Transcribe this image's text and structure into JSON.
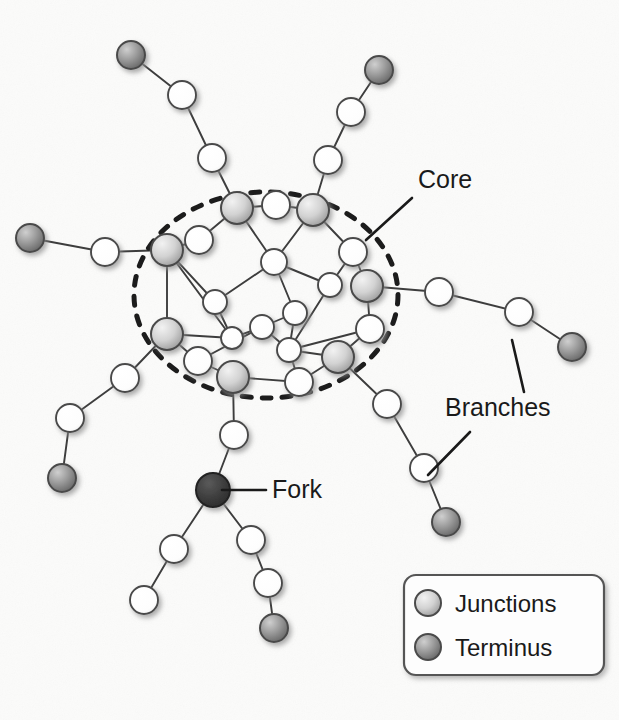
{
  "figure": {
    "kind": "network-diagram",
    "background_color": "#fbfbfa",
    "width": 619,
    "height": 720
  },
  "palette": {
    "edge": "#3d3d3d",
    "node_stroke": "#4a4a4a",
    "node_white_fill": "#ffffff",
    "junction_fill_light": "#e8e8e8",
    "junction_fill_dark": "#a6a6a6",
    "terminus_fill_light": "#bdbdbd",
    "terminus_fill_dark": "#6e6e6e",
    "fork_fill": "#3a3a3a",
    "text": "#1a1a1a",
    "dashed_ellipse": "#1c1c1c",
    "legend_border": "#555555",
    "legend_fill": "#fdfdfd",
    "shadow": "#9a9a9a"
  },
  "annotations": [
    {
      "id": "core",
      "label": "Core",
      "x": 418,
      "y": 188,
      "font_size": 25,
      "leaders": [
        {
          "x1": 412,
          "y1": 198,
          "x2": 366,
          "y2": 240
        }
      ]
    },
    {
      "id": "branches",
      "label": "Branches",
      "x": 445,
      "y": 416,
      "font_size": 25,
      "leaders": [
        {
          "x1": 524,
          "y1": 392,
          "x2": 512,
          "y2": 340
        },
        {
          "x1": 470,
          "y1": 432,
          "x2": 428,
          "y2": 475
        }
      ]
    },
    {
      "id": "fork",
      "label": "Fork",
      "x": 272,
      "y": 498,
      "font_size": 25,
      "leaders": [
        {
          "x1": 266,
          "y1": 490,
          "x2": 222,
          "y2": 490
        }
      ]
    }
  ],
  "core_boundary": {
    "shape": "ellipse",
    "cx": 266,
    "cy": 295,
    "rx": 132,
    "ry": 103,
    "dash": "9 11",
    "stroke_width": 5
  },
  "legend": {
    "box": {
      "x": 404,
      "y": 575,
      "width": 200,
      "height": 100,
      "radius": 12
    },
    "entries": [
      {
        "id": "junctions",
        "label": "Junctions",
        "swatch": "junction",
        "cx": 428,
        "cy": 603,
        "r": 13,
        "text_x": 455,
        "text_y": 612
      },
      {
        "id": "terminus",
        "label": "Terminus",
        "swatch": "terminus",
        "cx": 428,
        "cy": 647,
        "r": 13,
        "text_x": 455,
        "text_y": 656
      }
    ],
    "font_size": 24
  },
  "nodes": [
    {
      "id": "t_ul",
      "x": 131,
      "y": 55,
      "r": 14,
      "type": "terminus",
      "group": "branch-upper-left"
    },
    {
      "id": "b_ul1",
      "x": 182,
      "y": 95,
      "r": 14,
      "type": "white",
      "group": "branch-upper-left"
    },
    {
      "id": "b_ul2",
      "x": 212,
      "y": 158,
      "r": 14,
      "type": "white",
      "group": "branch-upper-left"
    },
    {
      "id": "t_ur",
      "x": 379,
      "y": 70,
      "r": 14,
      "type": "terminus",
      "group": "branch-upper-right"
    },
    {
      "id": "b_ur1",
      "x": 351,
      "y": 112,
      "r": 14,
      "type": "white",
      "group": "branch-upper-right"
    },
    {
      "id": "b_ur2",
      "x": 328,
      "y": 160,
      "r": 14,
      "type": "white",
      "group": "branch-upper-right"
    },
    {
      "id": "t_l",
      "x": 30,
      "y": 238,
      "r": 14,
      "type": "terminus",
      "group": "branch-left"
    },
    {
      "id": "b_l1",
      "x": 105,
      "y": 252,
      "r": 14,
      "type": "white",
      "group": "branch-left"
    },
    {
      "id": "b_r1",
      "x": 439,
      "y": 292,
      "r": 14,
      "type": "white",
      "group": "branch-right"
    },
    {
      "id": "b_r2",
      "x": 519,
      "y": 312,
      "r": 14,
      "type": "white",
      "group": "branch-right"
    },
    {
      "id": "t_r",
      "x": 572,
      "y": 347,
      "r": 14,
      "type": "terminus",
      "group": "branch-right"
    },
    {
      "id": "b_ll1",
      "x": 125,
      "y": 378,
      "r": 14,
      "type": "white",
      "group": "branch-lower-left"
    },
    {
      "id": "b_ll2",
      "x": 70,
      "y": 418,
      "r": 14,
      "type": "white",
      "group": "branch-lower-left"
    },
    {
      "id": "t_ll",
      "x": 62,
      "y": 478,
      "r": 14,
      "type": "terminus",
      "group": "branch-lower-left"
    },
    {
      "id": "b_lr1",
      "x": 387,
      "y": 404,
      "r": 14,
      "type": "white",
      "group": "branch-lower-right"
    },
    {
      "id": "b_lr2",
      "x": 424,
      "y": 468,
      "r": 14,
      "type": "white",
      "group": "branch-lower-right"
    },
    {
      "id": "t_lr",
      "x": 446,
      "y": 522,
      "r": 14,
      "type": "terminus",
      "group": "branch-lower-right"
    },
    {
      "id": "f_stem",
      "x": 234,
      "y": 435,
      "r": 14,
      "type": "white",
      "group": "fork-branch"
    },
    {
      "id": "fork",
      "x": 213,
      "y": 490,
      "r": 17,
      "type": "fork",
      "group": "fork-branch"
    },
    {
      "id": "f_a1",
      "x": 174,
      "y": 549,
      "r": 14,
      "type": "white",
      "group": "fork-branch"
    },
    {
      "id": "f_a2",
      "x": 144,
      "y": 600,
      "r": 14,
      "type": "white",
      "group": "fork-branch"
    },
    {
      "id": "f_b1",
      "x": 251,
      "y": 540,
      "r": 14,
      "type": "white",
      "group": "fork-branch"
    },
    {
      "id": "f_b2",
      "x": 268,
      "y": 583,
      "r": 14,
      "type": "white",
      "group": "fork-branch"
    },
    {
      "id": "t_f",
      "x": 274,
      "y": 628,
      "r": 14,
      "type": "terminus",
      "group": "fork-branch"
    },
    {
      "id": "j_n",
      "x": 237,
      "y": 208,
      "r": 16,
      "type": "junction",
      "group": "core"
    },
    {
      "id": "j_ne",
      "x": 313,
      "y": 210,
      "r": 16,
      "type": "junction",
      "group": "core"
    },
    {
      "id": "j_w",
      "x": 167,
      "y": 250,
      "r": 16,
      "type": "junction",
      "group": "core"
    },
    {
      "id": "j_e",
      "x": 367,
      "y": 286,
      "r": 16,
      "type": "junction",
      "group": "core"
    },
    {
      "id": "j_sw",
      "x": 167,
      "y": 334,
      "r": 16,
      "type": "junction",
      "group": "core"
    },
    {
      "id": "j_s",
      "x": 233,
      "y": 377,
      "r": 16,
      "type": "junction",
      "group": "core"
    },
    {
      "id": "j_se",
      "x": 338,
      "y": 357,
      "r": 16,
      "type": "junction",
      "group": "core"
    },
    {
      "id": "c_n1",
      "x": 276,
      "y": 205,
      "r": 14,
      "type": "white",
      "group": "core"
    },
    {
      "id": "c_nw",
      "x": 199,
      "y": 240,
      "r": 14,
      "type": "white",
      "group": "core"
    },
    {
      "id": "c_c1",
      "x": 274,
      "y": 262,
      "r": 13,
      "type": "white",
      "group": "core"
    },
    {
      "id": "c_ne2",
      "x": 353,
      "y": 252,
      "r": 14,
      "type": "white",
      "group": "core"
    },
    {
      "id": "c_c2",
      "x": 330,
      "y": 285,
      "r": 12,
      "type": "white",
      "group": "core"
    },
    {
      "id": "c_c3",
      "x": 295,
      "y": 313,
      "r": 12,
      "type": "white",
      "group": "core"
    },
    {
      "id": "c_w2",
      "x": 215,
      "y": 302,
      "r": 12,
      "type": "white",
      "group": "core"
    },
    {
      "id": "c_c4",
      "x": 262,
      "y": 327,
      "r": 12,
      "type": "white",
      "group": "core"
    },
    {
      "id": "c_c5",
      "x": 289,
      "y": 350,
      "r": 12,
      "type": "white",
      "group": "core"
    },
    {
      "id": "c_c6",
      "x": 232,
      "y": 338,
      "r": 11,
      "type": "white",
      "group": "core"
    },
    {
      "id": "c_e2",
      "x": 370,
      "y": 329,
      "r": 14,
      "type": "white",
      "group": "core"
    },
    {
      "id": "c_sw2",
      "x": 198,
      "y": 361,
      "r": 14,
      "type": "white",
      "group": "core"
    },
    {
      "id": "c_s2",
      "x": 299,
      "y": 382,
      "r": 14,
      "type": "white",
      "group": "core"
    }
  ],
  "edges": [
    [
      "t_ul",
      "b_ul1"
    ],
    [
      "b_ul1",
      "b_ul2"
    ],
    [
      "b_ul2",
      "j_n"
    ],
    [
      "t_ur",
      "b_ur1"
    ],
    [
      "b_ur1",
      "b_ur2"
    ],
    [
      "b_ur2",
      "j_ne"
    ],
    [
      "t_l",
      "b_l1"
    ],
    [
      "b_l1",
      "j_w"
    ],
    [
      "j_e",
      "b_r1"
    ],
    [
      "b_r1",
      "b_r2"
    ],
    [
      "b_r2",
      "t_r"
    ],
    [
      "j_sw",
      "b_ll1"
    ],
    [
      "b_ll1",
      "b_ll2"
    ],
    [
      "b_ll2",
      "t_ll"
    ],
    [
      "j_se",
      "b_lr1"
    ],
    [
      "b_lr1",
      "b_lr2"
    ],
    [
      "b_lr2",
      "t_lr"
    ],
    [
      "j_s",
      "f_stem"
    ],
    [
      "f_stem",
      "fork"
    ],
    [
      "fork",
      "f_a1"
    ],
    [
      "f_a1",
      "f_a2"
    ],
    [
      "fork",
      "f_b1"
    ],
    [
      "f_b1",
      "f_b2"
    ],
    [
      "f_b2",
      "t_f"
    ],
    [
      "j_n",
      "c_n1"
    ],
    [
      "c_n1",
      "j_ne"
    ],
    [
      "j_n",
      "c_nw"
    ],
    [
      "c_nw",
      "j_w"
    ],
    [
      "j_n",
      "c_c1"
    ],
    [
      "j_ne",
      "c_c1"
    ],
    [
      "j_ne",
      "c_ne2"
    ],
    [
      "c_ne2",
      "c_c2"
    ],
    [
      "c_ne2",
      "j_e"
    ],
    [
      "c_c1",
      "c_c2"
    ],
    [
      "c_c1",
      "c_c3"
    ],
    [
      "c_c1",
      "c_w2"
    ],
    [
      "c_c2",
      "c_c5"
    ],
    [
      "j_w",
      "c_w2"
    ],
    [
      "j_w",
      "j_sw"
    ],
    [
      "j_w",
      "c_c6"
    ],
    [
      "c_w2",
      "c_c6"
    ],
    [
      "c_c3",
      "c_c4"
    ],
    [
      "c_c3",
      "c_c5"
    ],
    [
      "c_c4",
      "c_c6"
    ],
    [
      "c_c4",
      "c_c5"
    ],
    [
      "c_c5",
      "c_e2"
    ],
    [
      "c_c5",
      "j_se"
    ],
    [
      "j_e",
      "c_e2"
    ],
    [
      "c_e2",
      "j_se"
    ],
    [
      "j_sw",
      "c_sw2"
    ],
    [
      "j_sw",
      "c_c6"
    ],
    [
      "c_sw2",
      "j_s"
    ],
    [
      "c_sw2",
      "c_c4"
    ],
    [
      "j_s",
      "c_s2"
    ],
    [
      "c_s2",
      "j_se"
    ],
    [
      "c_s2",
      "c_c5"
    ]
  ]
}
